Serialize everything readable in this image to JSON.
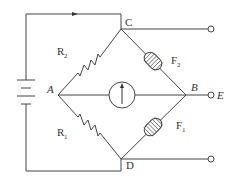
{
  "diagram": {
    "type": "wheatstone-bridge circuit",
    "nodes": {
      "A": {
        "label": "A",
        "style": "italic"
      },
      "B": {
        "label": "B",
        "style": "italic"
      },
      "C": {
        "label": "C",
        "style": "upright"
      },
      "D": {
        "label": "D",
        "style": "upright"
      },
      "E": {
        "label": "E",
        "style": "italic"
      }
    },
    "components": {
      "R2": {
        "label": "R",
        "sub": "2",
        "kind": "resistor",
        "between": [
          "A",
          "C"
        ]
      },
      "R1": {
        "label": "R",
        "sub": "1",
        "kind": "resistor",
        "between": [
          "A",
          "D"
        ]
      },
      "F2": {
        "label": "F",
        "sub": "2",
        "kind": "coil",
        "between": [
          "C",
          "B"
        ]
      },
      "F1": {
        "label": "F",
        "sub": "1",
        "kind": "coil",
        "between": [
          "D",
          "B"
        ]
      },
      "G": {
        "label": "",
        "kind": "galvanometer",
        "between": [
          "A",
          "B"
        ]
      },
      "battery": {
        "label": "",
        "kind": "battery"
      }
    },
    "terminals": [
      "C-output",
      "B-output (E)",
      "D-output"
    ],
    "current_arrow": {
      "direction": "right",
      "location": "top wire"
    },
    "colors": {
      "line": "#444444",
      "text": "#333333",
      "background": "#ffffff"
    }
  }
}
